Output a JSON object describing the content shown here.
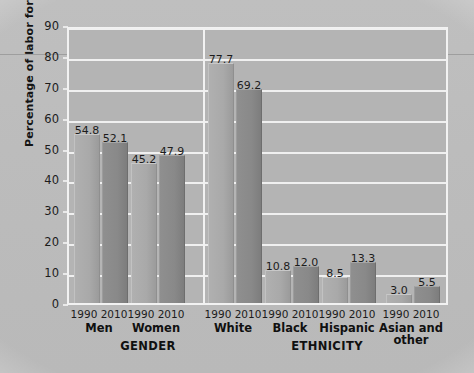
{
  "chart_data": {
    "type": "bar",
    "title": "",
    "xlabel": "",
    "ylabel": "Percentage of labor force",
    "ylim": [
      0,
      90
    ],
    "ytick_step": 10,
    "yticks": [
      "0",
      "10",
      "20",
      "30",
      "40",
      "50",
      "60",
      "70",
      "80",
      "90"
    ],
    "grid": true,
    "legend_position": "none",
    "series": [
      {
        "name": "1990",
        "values": [
          54.8,
          45.2,
          77.7,
          10.8,
          8.5,
          3.0
        ]
      },
      {
        "name": "2010",
        "values": [
          52.1,
          47.9,
          69.2,
          12.0,
          13.3,
          5.5
        ]
      }
    ],
    "categories": [
      "Men",
      "Women",
      "White",
      "Black",
      "Hispanic",
      "Asian and\nother"
    ],
    "groups": [
      {
        "axis_title": "GENDER",
        "categories": [
          {
            "label": "Men",
            "bars": [
              {
                "year": "1990",
                "value": "54.8"
              },
              {
                "year": "2010",
                "value": "52.1"
              }
            ]
          },
          {
            "label": "Women",
            "bars": [
              {
                "year": "1990",
                "value": "45.2"
              },
              {
                "year": "2010",
                "value": "47.9"
              }
            ]
          }
        ]
      },
      {
        "axis_title": "ETHNICITY",
        "categories": [
          {
            "label": "White",
            "bars": [
              {
                "year": "1990",
                "value": "77.7"
              },
              {
                "year": "2010",
                "value": "69.2"
              }
            ]
          },
          {
            "label": "Black",
            "bars": [
              {
                "year": "1990",
                "value": "10.8"
              },
              {
                "year": "2010",
                "value": "12.0"
              }
            ]
          },
          {
            "label": "Hispanic",
            "bars": [
              {
                "year": "1990",
                "value": "8.5"
              },
              {
                "year": "2010",
                "value": "13.3"
              }
            ]
          },
          {
            "label": "Asian and\nother",
            "bars": [
              {
                "year": "1990",
                "value": "3.0"
              },
              {
                "year": "2010",
                "value": "5.5"
              }
            ]
          }
        ]
      }
    ],
    "colors": {
      "bar_1990": "#aaaaaa",
      "bar_2010": "#898989",
      "plot_background": "#b4b4b4",
      "gridline": "#f0f0f0",
      "page_background": "#bcbcbc",
      "text": "#1c1c1c"
    }
  },
  "axis": {
    "y_ticks": [
      {
        "value": "90"
      },
      {
        "value": "80"
      },
      {
        "value": "70"
      },
      {
        "value": "60"
      },
      {
        "value": "50"
      },
      {
        "value": "40"
      },
      {
        "value": "30"
      },
      {
        "value": "20"
      },
      {
        "value": "10"
      },
      {
        "value": "0"
      }
    ],
    "y_title": "Percentage of labor force",
    "group_titles": [
      {
        "label": "GENDER"
      },
      {
        "label": "ETHNICITY"
      }
    ]
  },
  "x_axis": {
    "year_pairs": [
      {
        "text": "1990 2010"
      },
      {
        "text": "1990 2010"
      },
      {
        "text": "1990 2010"
      },
      {
        "text": "1990 2010"
      },
      {
        "text": "1990 2010"
      },
      {
        "text": "1990 2010"
      }
    ],
    "category_labels": [
      {
        "text": "Men"
      },
      {
        "text": "Women"
      },
      {
        "text": "White"
      },
      {
        "text": "Black"
      },
      {
        "text": "Hispanic"
      },
      {
        "text": "Asian and\nother"
      }
    ]
  }
}
